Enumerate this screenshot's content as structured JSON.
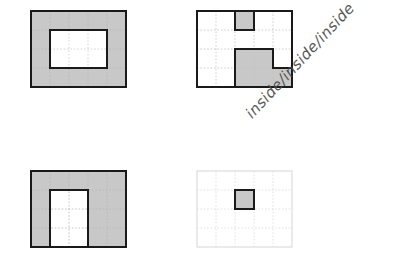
{
  "page": {
    "background": "#ffffff",
    "width": 410,
    "height": 255
  },
  "style": {
    "shaded_fill": "#c8c8c8",
    "empty_fill": "#ffffff",
    "outline_color": "#1a1a1a",
    "grid_color": "#b5b5b5",
    "faint_grid_color": "#d9d9d9",
    "faint_outline_color": "#dcdcdc",
    "annotation_color": "#4a4a4a"
  },
  "annotation": {
    "text": "inside/inside/inside",
    "rotation_deg": -47
  },
  "figures": [
    {
      "id": "figure-top-left",
      "name": "gray-rectangle-with-rectangular-hole",
      "position": {
        "x": 30,
        "y": 10
      },
      "grid": {
        "cols": 5,
        "rows": 4,
        "cell": 19
      },
      "outline": "bold",
      "base_fill": "shaded",
      "holes": [
        {
          "x": 1,
          "y": 1,
          "w": 3,
          "h": 2,
          "fill": "empty",
          "outline": "bold"
        }
      ],
      "shaded_cells": "all-except-hole",
      "shaded_area_cells": 14,
      "empty_area_cells": 6
    },
    {
      "id": "figure-top-right",
      "name": "white-rectangle-with-notch-and-step",
      "position": {
        "x": 196,
        "y": 10
      },
      "grid": {
        "cols": 5,
        "rows": 4,
        "cell": 19
      },
      "outline": "bold",
      "base_fill": "empty",
      "regions": [
        {
          "name": "top-notch",
          "cells": [
            {
              "x": 2,
              "y": 0,
              "w": 1,
              "h": 1
            }
          ],
          "fill": "shaded"
        },
        {
          "name": "bottom-step-upper",
          "cells": [
            {
              "x": 2,
              "y": 2,
              "w": 2,
              "h": 1
            }
          ],
          "fill": "shaded"
        },
        {
          "name": "bottom-step-lower",
          "cells": [
            {
              "x": 2,
              "y": 3,
              "w": 3,
              "h": 1
            }
          ],
          "fill": "shaded"
        }
      ],
      "shaded_area_cells": 6,
      "empty_area_cells": 14
    },
    {
      "id": "figure-bottom-left",
      "name": "gray-arch-u-shape",
      "position": {
        "x": 30,
        "y": 170
      },
      "grid": {
        "cols": 5,
        "rows": 4,
        "cell": 19
      },
      "outline": "bold",
      "base_fill": "shaded",
      "holes": [
        {
          "x": 1,
          "y": 1,
          "w": 2,
          "h": 3,
          "fill": "empty",
          "outline": "bold",
          "open_edge": "bottom"
        }
      ],
      "shaded_area_cells": 14,
      "empty_area_cells": 6
    },
    {
      "id": "figure-bottom-right",
      "name": "faint-grid-with-single-shaded-cell",
      "position": {
        "x": 196,
        "y": 170
      },
      "grid": {
        "cols": 5,
        "rows": 4,
        "cell": 19
      },
      "outline": "faint",
      "base_fill": "empty",
      "regions": [
        {
          "name": "single-shaded-cell",
          "cells": [
            {
              "x": 2,
              "y": 1,
              "w": 1,
              "h": 1
            }
          ],
          "fill": "shaded",
          "outline": "bold"
        }
      ],
      "shaded_area_cells": 1,
      "empty_area_cells": 19
    }
  ]
}
